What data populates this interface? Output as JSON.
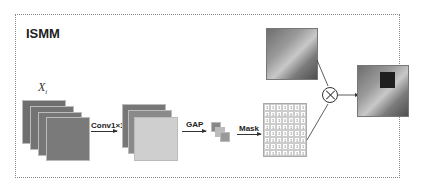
{
  "title": "ISMM",
  "input_label": "X_i",
  "steps": {
    "conv": "Conv1×1",
    "gap": "GAP",
    "mask": "Mask"
  },
  "mask_grid": [
    [
      1,
      1,
      1,
      1,
      1,
      1,
      1
    ],
    [
      1,
      1,
      1,
      0,
      0,
      1,
      1
    ],
    [
      1,
      1,
      1,
      0,
      0,
      1,
      1
    ],
    [
      1,
      1,
      1,
      1,
      1,
      1,
      1
    ],
    [
      1,
      1,
      1,
      1,
      1,
      1,
      1
    ],
    [
      1,
      1,
      1,
      1,
      1,
      1,
      1
    ],
    [
      1,
      1,
      1,
      1,
      1,
      1,
      1
    ],
    [
      1,
      1,
      1,
      1,
      1,
      1,
      1
    ]
  ],
  "colors": {
    "feature_dark": "#6f6f6f",
    "feature_light": "#cfcfcf",
    "line": "#333333"
  }
}
